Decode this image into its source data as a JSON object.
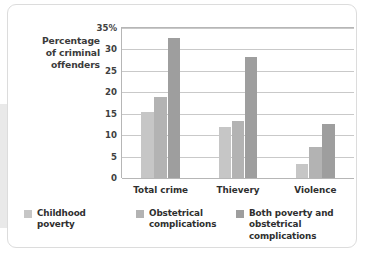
{
  "chart_data": {
    "type": "bar",
    "title": "",
    "subtitle": "",
    "xlabel": "",
    "ylabel": "Percentage of criminal offenders",
    "ylabel_lines": [
      "Percentage",
      "of criminal",
      "offenders"
    ],
    "categories": [
      "Total crime",
      "Thievery",
      "Violence"
    ],
    "series": [
      {
        "name": "Childhood poverty",
        "values": [
          15.5,
          12.0,
          3.2
        ],
        "color": "#c6c6c6"
      },
      {
        "name": "Obstetrical complications",
        "values": [
          19.0,
          13.2,
          7.2
        ],
        "color": "#b3b3b3"
      },
      {
        "name": "Both poverty and obstetrical complications",
        "values": [
          32.7,
          28.2,
          12.5
        ],
        "color": "#9e9e9e"
      }
    ],
    "ylim": [
      0,
      35
    ],
    "ytick_values": [
      0,
      5,
      10,
      15,
      20,
      25,
      30,
      35
    ],
    "ytick_labels": [
      "0",
      "5",
      "10",
      "15",
      "20",
      "25",
      "30",
      "35%"
    ],
    "grid": true,
    "legend_position": "bottom"
  },
  "legend": {
    "items": [
      {
        "label_lines": [
          "Childhood",
          "poverty"
        ],
        "color": "#c6c6c6"
      },
      {
        "label_lines": [
          "Obstetrical",
          "complications"
        ],
        "color": "#b3b3b3"
      },
      {
        "label_lines": [
          "Both poverty and",
          "obstetrical complications"
        ],
        "color": "#9e9e9e"
      }
    ]
  }
}
